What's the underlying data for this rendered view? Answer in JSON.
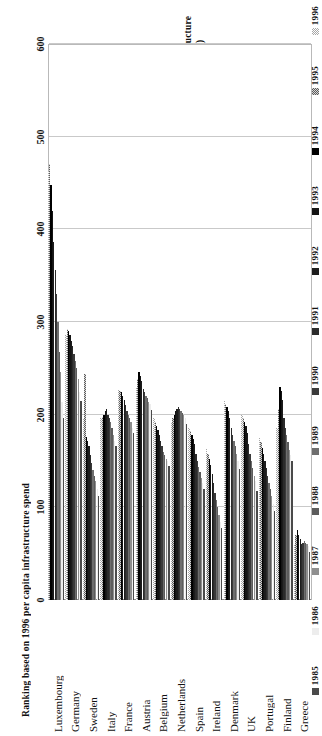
{
  "chart_data": {
    "type": "bar",
    "orientation": "horizontal",
    "title": "",
    "xlabel": "Per capita Transport Infrastructure Investment (1994 prices)",
    "ylabel": "Ranking based on 1996 per capita infrastructure spend",
    "xlim": [
      0,
      600
    ],
    "xticks": [
      0,
      100,
      200,
      300,
      400,
      500,
      600
    ],
    "grid": true,
    "legend_position": "right",
    "categories": [
      "Greece",
      "Finland",
      "Portugal",
      "UK",
      "Denmark",
      "Ireland",
      "Spain",
      "Netherlands",
      "Belgium",
      "Austria",
      "France",
      "Italy",
      "Sweden",
      "Germany",
      "Luxembourg"
    ],
    "series": [
      {
        "name": "1985",
        "color": "#4a4a4a",
        "pattern": "solid",
        "values": [
          52,
          150,
          96,
          118,
          141,
          78,
          120,
          190,
          145,
          205,
          180,
          166,
          112,
          215,
          196
        ]
      },
      {
        "name": "1986",
        "color": "#ededed",
        "pattern": "solid",
        "values": [
          58,
          156,
          104,
          128,
          150,
          84,
          126,
          196,
          150,
          212,
          186,
          172,
          120,
          224,
          214
        ]
      },
      {
        "name": "1987",
        "color": "#8f8f8f",
        "pattern": "solid",
        "values": [
          60,
          162,
          112,
          134,
          158,
          92,
          132,
          200,
          152,
          214,
          192,
          178,
          128,
          238,
          246
        ]
      },
      {
        "name": "1988",
        "color": "#5c5c5c",
        "pattern": "solid",
        "values": [
          62,
          170,
          120,
          142,
          166,
          100,
          138,
          202,
          156,
          218,
          196,
          186,
          134,
          250,
          268
        ]
      },
      {
        "name": "1989",
        "color": "#6e6e6e",
        "pattern": "solid",
        "values": [
          64,
          178,
          126,
          150,
          172,
          108,
          144,
          204,
          160,
          220,
          200,
          192,
          140,
          258,
          300
        ]
      },
      {
        "name": "1990",
        "color": "#3a3a3a",
        "pattern": "solid",
        "values": [
          62,
          186,
          134,
          158,
          178,
          116,
          150,
          206,
          166,
          224,
          204,
          196,
          148,
          266,
          330
        ]
      },
      {
        "name": "1991",
        "color": "#2b2b2b",
        "pattern": "solid",
        "values": [
          60,
          196,
          142,
          168,
          186,
          126,
          158,
          208,
          172,
          228,
          210,
          200,
          156,
          274,
          356
        ]
      },
      {
        "name": "1992",
        "color": "#1c1c1c",
        "pattern": "solid",
        "values": [
          66,
          216,
          150,
          180,
          196,
          136,
          168,
          206,
          178,
          236,
          216,
          206,
          166,
          280,
          386
        ]
      },
      {
        "name": "1993",
        "color": "#141414",
        "pattern": "solid",
        "values": [
          70,
          226,
          158,
          188,
          204,
          146,
          174,
          204,
          184,
          242,
          220,
          204,
          172,
          286,
          420
        ]
      },
      {
        "name": "1994",
        "color": "#000000",
        "pattern": "solid",
        "values": [
          76,
          230,
          164,
          192,
          208,
          152,
          178,
          200,
          188,
          246,
          224,
          200,
          176,
          290,
          448
        ]
      },
      {
        "name": "1995",
        "color": "#5a5a5a",
        "pattern": "checker-dark",
        "values": [
          70,
          206,
          170,
          196,
          212,
          158,
          182,
          196,
          192,
          238,
          226,
          198,
          244,
          292,
          470
        ]
      },
      {
        "name": "1996",
        "color": "#a8a8a8",
        "pattern": "checker-light",
        "values": [
          60,
          186,
          176,
          200,
          216,
          164,
          186,
          192,
          196,
          230,
          228,
          196,
          196,
          286,
          462
        ]
      }
    ]
  },
  "axis": {
    "value_title_line1": "Per capita Transport Infrastructure",
    "value_title_line2": "Investment (1994 prices)",
    "category_title": "Ranking based on 1996 per capita infrastructure spend"
  },
  "legend": {
    "items": [
      {
        "label": "1996",
        "swatch": "legend-swatch-1996"
      },
      {
        "label": "1995",
        "swatch": "legend-swatch-1995"
      },
      {
        "label": "1994",
        "swatch": "legend-swatch-1994"
      },
      {
        "label": "1993",
        "swatch": "legend-swatch-1993"
      },
      {
        "label": "1992",
        "swatch": "legend-swatch-1992"
      },
      {
        "label": "1991",
        "swatch": "legend-swatch-1991"
      },
      {
        "label": "1990",
        "swatch": "legend-swatch-1990"
      },
      {
        "label": "1989",
        "swatch": "legend-swatch-1989"
      },
      {
        "label": "1988",
        "swatch": "legend-swatch-1988"
      },
      {
        "label": "1987",
        "swatch": "legend-swatch-1987"
      },
      {
        "label": "1986",
        "swatch": "legend-swatch-1986"
      },
      {
        "label": "1985",
        "swatch": "legend-swatch-1985"
      }
    ]
  }
}
